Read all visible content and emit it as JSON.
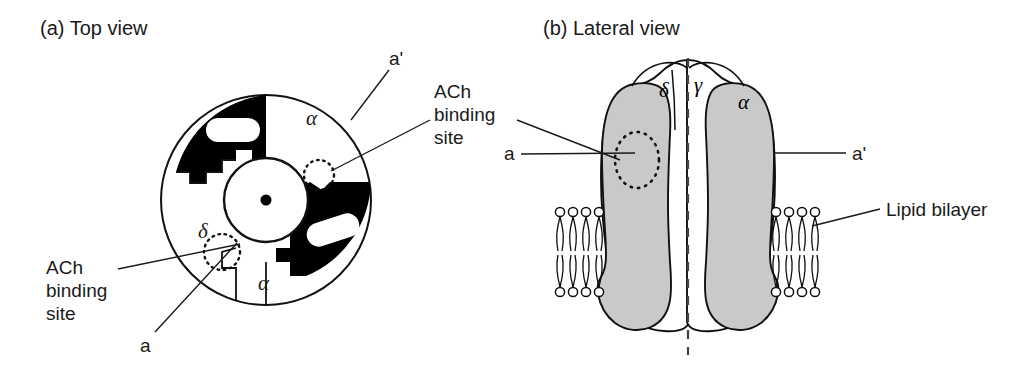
{
  "figure": {
    "panels": [
      {
        "id": "a",
        "caption": "(a)  Top view",
        "labels": {
          "a_prime": "a'",
          "ach_right": "ACh\nbinding\nsite",
          "ach_right_line1": "ACh",
          "ach_right_line2": "binding",
          "ach_right_line3": "site",
          "a_right": "a",
          "ach_left_line1": "ACh",
          "ach_left_line2": "binding",
          "ach_left_line3": "site",
          "a_left": "a",
          "subunit_alpha_top": "α",
          "subunit_alpha_bottom": "α",
          "subunit_delta": "δ"
        }
      },
      {
        "id": "b",
        "caption": "(b)  Lateral view",
        "labels": {
          "a_left": "a",
          "a_prime_right": "a'",
          "lipid_bilayer": "Lipid bilayer",
          "subunit_delta": "δ",
          "subunit_gamma": "γ",
          "subunit_alpha": "α"
        }
      }
    ],
    "colors": {
      "background": "#ffffff",
      "ink": "#1a1a1a",
      "subunit_dark": "#000000",
      "subunit_light": "#ffffff",
      "subunit_shaded": "#c9c9c9",
      "outline": "#111111"
    }
  }
}
